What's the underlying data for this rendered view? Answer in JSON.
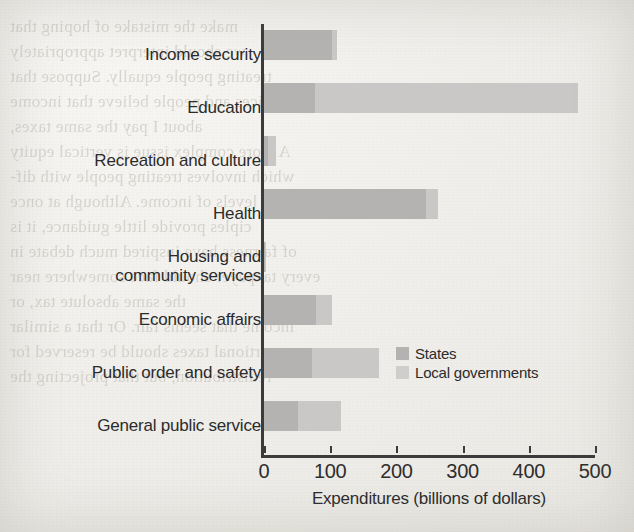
{
  "chart_data": {
    "type": "bar",
    "orientation": "horizontal",
    "stacked": true,
    "title": "",
    "xlabel": "Expenditures (billions of dollars)",
    "ylabel": "",
    "xlim": [
      0,
      500
    ],
    "xticks": [
      0,
      100,
      200,
      300,
      400,
      500
    ],
    "grid": false,
    "legend_position": "inside-right-center",
    "categories": [
      "Income security",
      "Education",
      "Recreation and culture",
      "Health",
      "Housing and community services",
      "Economic affairs",
      "Public order and safety",
      "General public service"
    ],
    "series": [
      {
        "name": "States",
        "color": "#b4b3b1",
        "values": [
          103,
          77,
          6,
          245,
          2,
          78,
          72,
          52
        ]
      },
      {
        "name": "Local governments",
        "color": "#c9c8c6",
        "values": [
          8,
          397,
          12,
          18,
          1,
          24,
          102,
          65
        ]
      }
    ],
    "totals": [
      111,
      474,
      18,
      263,
      3,
      102,
      174,
      117
    ]
  },
  "axis": {
    "tick_labels": [
      "0",
      "100",
      "200",
      "300",
      "400",
      "500"
    ],
    "x_title": "Expenditures (billions of dollars)"
  },
  "legend": {
    "entries": [
      {
        "label": "States",
        "swatch": "legend-swatch-states"
      },
      {
        "label": "Local governments",
        "swatch": "legend-swatch-local"
      }
    ]
  },
  "categories": [
    {
      "line1": "Income security",
      "line2": ""
    },
    {
      "line1": "Education",
      "line2": ""
    },
    {
      "line1": "Recreation and culture",
      "line2": ""
    },
    {
      "line1": "Health",
      "line2": ""
    },
    {
      "line1": "Housing and",
      "line2": "community services"
    },
    {
      "line1": "Economic affairs",
      "line2": ""
    },
    {
      "line1": "Public order and safety",
      "line2": ""
    },
    {
      "line1": "General public service",
      "line2": ""
    }
  ],
  "background": {
    "bleed_through_text": "make the mistake of hoping that\nwe should interpret appropriately\ntreating people equally. Suppose that\npeople's choices and people believe that income\nabout I pay the same taxes,\nA more complex issue is vertical equity\nwhich involves treating people with dif-\nferent levels of income. Although at once\nciples provide little guidance, it is\nof fairness have inspired much debate in\nevery taxpayer should face somewhere near\nthe same absolute tax, or\nincome that seems fair. Or that a similar\nproportional taxes should be reserved for\nredistribution, but that projecting the"
  },
  "colors": {
    "states": "#b4b3b1",
    "local_governments": "#c9c8c6",
    "axis": "#3b3b3b",
    "text": "#2b2b2b",
    "paper": "#f1efec"
  }
}
